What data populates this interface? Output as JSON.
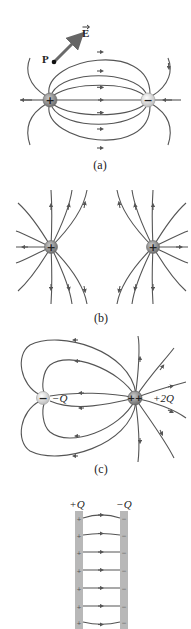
{
  "figure": {
    "panels": [
      {
        "id": "a",
        "caption": "(a)",
        "description": "Electric field lines of an electric dipole (positive and negative charge)",
        "charges": [
          {
            "sign": "+",
            "symbol": "+"
          },
          {
            "sign": "-",
            "symbol": "−"
          }
        ],
        "point_label": "P",
        "vector_label": "E"
      },
      {
        "id": "b",
        "caption": "(b)",
        "description": "Electric field lines of two equal positive charges",
        "charges": [
          {
            "sign": "+",
            "symbol": "+"
          },
          {
            "sign": "+",
            "symbol": "+"
          }
        ]
      },
      {
        "id": "c",
        "caption": "(c)",
        "description": "Field lines of charges -Q and +2Q",
        "charges": [
          {
            "sign": "-",
            "symbol": "−",
            "label": "−Q"
          },
          {
            "sign": "+",
            "symbol": "++",
            "label": "+2Q"
          }
        ]
      },
      {
        "id": "d",
        "caption": "",
        "description": "Uniform field between parallel plates",
        "plates": [
          {
            "label": "+Q",
            "plate_sign": "+"
          },
          {
            "label": "−Q",
            "plate_sign": "−"
          }
        ]
      }
    ],
    "colors": {
      "field_line": "#555555",
      "positive_charge": "#8a8a8a",
      "negative_charge": "#e0e0e0",
      "vector": "#6a6a6a",
      "plate": "#b8b8b8"
    }
  }
}
